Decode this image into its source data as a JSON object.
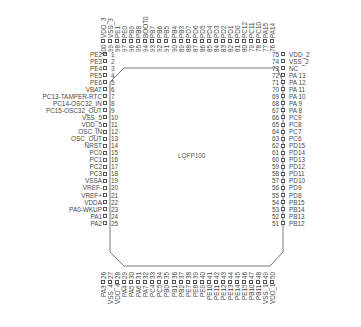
{
  "package": {
    "name": "LQFP100",
    "line_color": "#555555",
    "text_color": "#4a4a4a"
  },
  "pins": {
    "left": [
      {
        "num": "1",
        "name": "PE2"
      },
      {
        "num": "2",
        "name": "PE3"
      },
      {
        "num": "3",
        "name": "PE4"
      },
      {
        "num": "4",
        "name": "PE5"
      },
      {
        "num": "5",
        "name": "PE6"
      },
      {
        "num": "6",
        "name": "VBAT"
      },
      {
        "num": "7",
        "name": "PC13-TAMPER-RTC"
      },
      {
        "num": "8",
        "name": "PC14-OSC32_IN"
      },
      {
        "num": "9",
        "name": "PC15-OSC32_OUT"
      },
      {
        "num": "10",
        "name": "VSS_5"
      },
      {
        "num": "11",
        "name": "VDD_5"
      },
      {
        "num": "12",
        "name": "OSC_IN"
      },
      {
        "num": "13",
        "name": "OSC_OUT"
      },
      {
        "num": "14",
        "name": "NRST"
      },
      {
        "num": "15",
        "name": "PC0"
      },
      {
        "num": "16",
        "name": "PC1"
      },
      {
        "num": "17",
        "name": "PC2"
      },
      {
        "num": "18",
        "name": "PC3"
      },
      {
        "num": "19",
        "name": "VSSA"
      },
      {
        "num": "20",
        "name": "VREF-"
      },
      {
        "num": "21",
        "name": "VREF+"
      },
      {
        "num": "22",
        "name": "VDDA"
      },
      {
        "num": "23",
        "name": "PA0-WKUP"
      },
      {
        "num": "24",
        "name": "PA1"
      },
      {
        "num": "25",
        "name": "PA2"
      }
    ],
    "bottom": [
      {
        "num": "26",
        "name": "PA3"
      },
      {
        "num": "27",
        "name": "VSS_4"
      },
      {
        "num": "28",
        "name": "VDD_4"
      },
      {
        "num": "29",
        "name": "PA4"
      },
      {
        "num": "30",
        "name": "PA5"
      },
      {
        "num": "31",
        "name": "PA6"
      },
      {
        "num": "32",
        "name": "PA7"
      },
      {
        "num": "33",
        "name": "PC4"
      },
      {
        "num": "34",
        "name": "PC5"
      },
      {
        "num": "35",
        "name": "PB0"
      },
      {
        "num": "36",
        "name": "PB1"
      },
      {
        "num": "37",
        "name": "PB2"
      },
      {
        "num": "38",
        "name": "PE7"
      },
      {
        "num": "39",
        "name": "PE8"
      },
      {
        "num": "40",
        "name": "PE9"
      },
      {
        "num": "41",
        "name": "PE10"
      },
      {
        "num": "42",
        "name": "PE11"
      },
      {
        "num": "43",
        "name": "PE12"
      },
      {
        "num": "44",
        "name": "PE13"
      },
      {
        "num": "45",
        "name": "PE14"
      },
      {
        "num": "46",
        "name": "PE15"
      },
      {
        "num": "47",
        "name": "PB10"
      },
      {
        "num": "48",
        "name": "PB11"
      },
      {
        "num": "49",
        "name": "VSS_1"
      },
      {
        "num": "50",
        "name": "VDD_1"
      }
    ],
    "right": [
      {
        "num": "75",
        "name": "VDD_2"
      },
      {
        "num": "74",
        "name": "VSS_2"
      },
      {
        "num": "73",
        "name": "NC"
      },
      {
        "num": "72",
        "name": "PA 13"
      },
      {
        "num": "71",
        "name": "PA 12"
      },
      {
        "num": "70",
        "name": "PA 11"
      },
      {
        "num": "69",
        "name": "PA 10"
      },
      {
        "num": "68",
        "name": "PA 9"
      },
      {
        "num": "67",
        "name": "PA 8"
      },
      {
        "num": "66",
        "name": "PC9"
      },
      {
        "num": "65",
        "name": "PC8"
      },
      {
        "num": "64",
        "name": "PC7"
      },
      {
        "num": "63",
        "name": "PC6"
      },
      {
        "num": "62",
        "name": "PD15"
      },
      {
        "num": "61",
        "name": "PD14"
      },
      {
        "num": "60",
        "name": "PD13"
      },
      {
        "num": "59",
        "name": "PD12"
      },
      {
        "num": "58",
        "name": "PD11"
      },
      {
        "num": "57",
        "name": "PD10"
      },
      {
        "num": "56",
        "name": "PD9"
      },
      {
        "num": "55",
        "name": "PD8"
      },
      {
        "num": "54",
        "name": "PB15"
      },
      {
        "num": "53",
        "name": "PB14"
      },
      {
        "num": "52",
        "name": "PB13"
      },
      {
        "num": "51",
        "name": "PB12"
      }
    ],
    "top": [
      {
        "num": "100",
        "name": "VDD_3"
      },
      {
        "num": "99",
        "name": "VSS_3"
      },
      {
        "num": "98",
        "name": "PE1"
      },
      {
        "num": "97",
        "name": "PE0"
      },
      {
        "num": "96",
        "name": "PB9"
      },
      {
        "num": "95",
        "name": "PB8"
      },
      {
        "num": "94",
        "name": "BOOT0"
      },
      {
        "num": "93",
        "name": "PB7"
      },
      {
        "num": "92",
        "name": "PB6"
      },
      {
        "num": "91",
        "name": "PB5"
      },
      {
        "num": "90",
        "name": "PB4"
      },
      {
        "num": "89",
        "name": "PB3"
      },
      {
        "num": "88",
        "name": "PD7"
      },
      {
        "num": "87",
        "name": "PD6"
      },
      {
        "num": "86",
        "name": "PD5"
      },
      {
        "num": "85",
        "name": "PD4"
      },
      {
        "num": "84",
        "name": "PD3"
      },
      {
        "num": "83",
        "name": "PD2"
      },
      {
        "num": "82",
        "name": "PD1"
      },
      {
        "num": "81",
        "name": "PD0"
      },
      {
        "num": "80",
        "name": "PC12"
      },
      {
        "num": "79",
        "name": "PC11"
      },
      {
        "num": "78",
        "name": "PC10"
      },
      {
        "num": "77",
        "name": "PA15"
      },
      {
        "num": "76",
        "name": "PA14"
      }
    ]
  }
}
